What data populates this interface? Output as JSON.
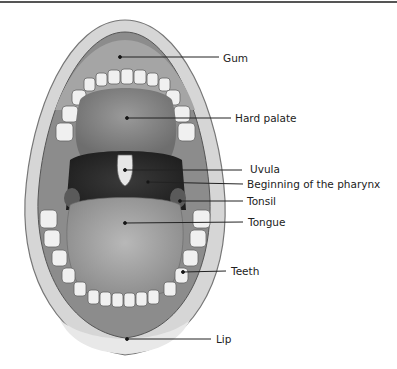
{
  "diagram": {
    "labels": [
      {
        "text": "Gum",
        "x": 223,
        "y": 52,
        "dot": [
          120,
          57
        ],
        "lineEnd": 219
      },
      {
        "text": "Hard palate",
        "x": 235,
        "y": 112,
        "dot": [
          127,
          118
        ],
        "lineEnd": 231
      },
      {
        "text": "Uvula",
        "x": 250,
        "y": 163,
        "dot": [
          125,
          170
        ],
        "lineEnd": 242
      },
      {
        "text": "Beginning of the pharynx",
        "x": 247,
        "y": 178,
        "dot": [
          148,
          182
        ],
        "lineEnd": 243
      },
      {
        "text": "Tonsil",
        "x": 247,
        "y": 195,
        "dot": [
          180,
          201
        ],
        "lineEnd": 243
      },
      {
        "text": "Tongue",
        "x": 248,
        "y": 216,
        "dot": [
          125,
          223
        ],
        "lineEnd": 243
      },
      {
        "text": "Teeth",
        "x": 231,
        "y": 265,
        "dot": [
          183,
          272
        ],
        "lineEnd": 226
      },
      {
        "text": "Lip",
        "x": 216,
        "y": 333,
        "dot": [
          127,
          339
        ],
        "lineEnd": 211
      }
    ]
  }
}
